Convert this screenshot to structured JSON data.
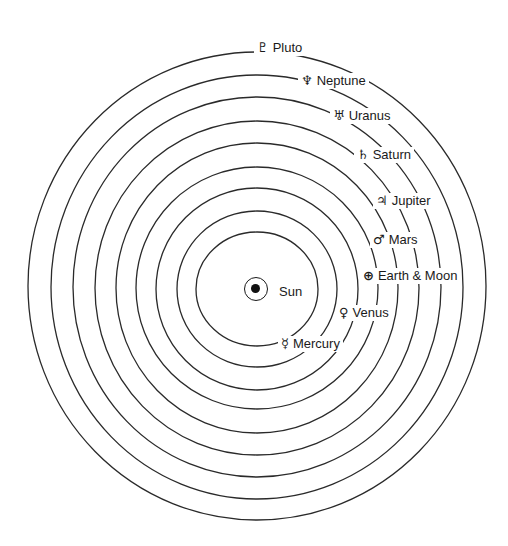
{
  "diagram": {
    "center": {
      "x": 257,
      "y": 289
    },
    "orbit_radii": [
      232,
      209,
      187,
      165,
      143,
      121,
      101,
      79,
      58
    ],
    "orbit_color": "#2a2a2a",
    "sun": {
      "label": "Sun",
      "symbol": "sun-circled-dot"
    },
    "planets": [
      {
        "name": "Pluto",
        "symbol": "♇",
        "icon": "pluto-icon"
      },
      {
        "name": "Neptune",
        "symbol": "♆",
        "icon": "neptune-icon"
      },
      {
        "name": "Uranus",
        "symbol": "♅",
        "icon": "uranus-icon"
      },
      {
        "name": "Saturn",
        "symbol": "♄",
        "icon": "saturn-icon"
      },
      {
        "name": "Jupiter",
        "symbol": "♃",
        "icon": "jupiter-icon"
      },
      {
        "name": "Mars",
        "symbol": "♂",
        "icon": "mars-icon"
      },
      {
        "name": "Earth & Moon",
        "symbol": "⊕",
        "icon": "earth-icon"
      },
      {
        "name": "Venus",
        "symbol": "♀",
        "icon": "venus-icon"
      },
      {
        "name": "Mercury",
        "symbol": "☿",
        "icon": "mercury-icon"
      }
    ]
  }
}
